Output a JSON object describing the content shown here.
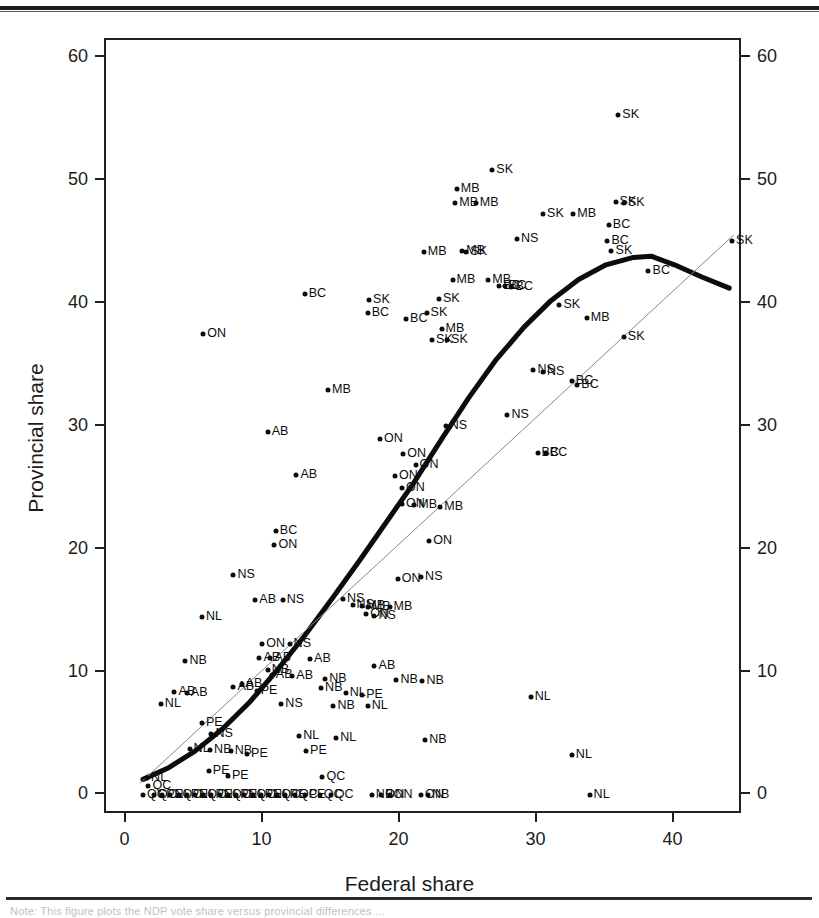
{
  "figure": {
    "caption": "Note: This figure plots the NDP vote share versus provincial differences ...",
    "xtitle": "Federal share",
    "ytitle": "Provincial share"
  },
  "axes": {
    "x_ticks": [
      "0",
      "10",
      "20",
      "30",
      "40"
    ],
    "y_ticks": [
      "0",
      "10",
      "20",
      "30",
      "40",
      "50",
      "60"
    ]
  },
  "chart_data": {
    "type": "scatter",
    "title": "",
    "xlabel": "Federal share",
    "ylabel": "Provincial share",
    "xlim": [
      -1.5,
      45.0
    ],
    "ylim": [
      -1.6,
      61.5
    ],
    "xticks": [
      0,
      10,
      20,
      30,
      40
    ],
    "yticks": [
      0,
      10,
      20,
      30,
      40,
      50,
      60
    ],
    "grid": false,
    "legend": false,
    "point_label_field": "province",
    "series": [
      {
        "name": "Provincial vs federal NDP share",
        "marker": "filled-circle",
        "color": "#0c0c0c",
        "points": [
          {
            "x": 35.9,
            "y": 55.4,
            "label": "SK"
          },
          {
            "x": 26.7,
            "y": 50.9,
            "label": "SK"
          },
          {
            "x": 24.1,
            "y": 49.4,
            "label": "MB"
          },
          {
            "x": 24.0,
            "y": 48.2,
            "label": "MB"
          },
          {
            "x": 25.5,
            "y": 48.2,
            "label": "MB"
          },
          {
            "x": 35.7,
            "y": 48.3,
            "label": "SK"
          },
          {
            "x": 36.3,
            "y": 48.2,
            "label": "SK"
          },
          {
            "x": 30.4,
            "y": 47.3,
            "label": "SK"
          },
          {
            "x": 32.6,
            "y": 47.3,
            "label": "MB"
          },
          {
            "x": 35.2,
            "y": 46.4,
            "label": "BC"
          },
          {
            "x": 35.1,
            "y": 45.1,
            "label": "BC"
          },
          {
            "x": 28.5,
            "y": 45.3,
            "label": "NS"
          },
          {
            "x": 35.4,
            "y": 44.3,
            "label": "SK"
          },
          {
            "x": 44.2,
            "y": 45.1,
            "label": "SK"
          },
          {
            "x": 21.7,
            "y": 44.2,
            "label": "MB"
          },
          {
            "x": 24.5,
            "y": 44.3,
            "label": "MB"
          },
          {
            "x": 24.8,
            "y": 44.2,
            "label": "SK"
          },
          {
            "x": 38.1,
            "y": 42.7,
            "label": "BC"
          },
          {
            "x": 23.8,
            "y": 42.0,
            "label": "MB"
          },
          {
            "x": 26.4,
            "y": 42.0,
            "label": "MB"
          },
          {
            "x": 27.2,
            "y": 41.5,
            "label": "BC"
          },
          {
            "x": 27.6,
            "y": 41.5,
            "label": "BC"
          },
          {
            "x": 28.1,
            "y": 41.4,
            "label": "BC"
          },
          {
            "x": 13.0,
            "y": 40.8,
            "label": "BC"
          },
          {
            "x": 17.7,
            "y": 40.3,
            "label": "SK"
          },
          {
            "x": 22.8,
            "y": 40.4,
            "label": "SK"
          },
          {
            "x": 17.6,
            "y": 39.3,
            "label": "BC"
          },
          {
            "x": 31.6,
            "y": 39.9,
            "label": "SK"
          },
          {
            "x": 21.9,
            "y": 39.3,
            "label": "SK"
          },
          {
            "x": 33.6,
            "y": 38.9,
            "label": "MB"
          },
          {
            "x": 20.4,
            "y": 38.8,
            "label": "BC"
          },
          {
            "x": 5.6,
            "y": 37.6,
            "label": "ON"
          },
          {
            "x": 36.3,
            "y": 37.3,
            "label": "SK"
          },
          {
            "x": 23.0,
            "y": 38.0,
            "label": "MB"
          },
          {
            "x": 22.3,
            "y": 37.1,
            "label": "SK"
          },
          {
            "x": 23.4,
            "y": 37.1,
            "label": "SK"
          },
          {
            "x": 29.7,
            "y": 34.6,
            "label": "NS"
          },
          {
            "x": 30.4,
            "y": 34.5,
            "label": "NS"
          },
          {
            "x": 32.5,
            "y": 33.7,
            "label": "BC"
          },
          {
            "x": 32.9,
            "y": 33.4,
            "label": "BC"
          },
          {
            "x": 14.7,
            "y": 33.0,
            "label": "MB"
          },
          {
            "x": 27.8,
            "y": 31.0,
            "label": "NS"
          },
          {
            "x": 10.3,
            "y": 29.6,
            "label": "AB"
          },
          {
            "x": 18.5,
            "y": 29.0,
            "label": "ON"
          },
          {
            "x": 23.3,
            "y": 30.1,
            "label": "NS"
          },
          {
            "x": 20.2,
            "y": 27.8,
            "label": "ON"
          },
          {
            "x": 21.1,
            "y": 26.9,
            "label": "ON"
          },
          {
            "x": 19.6,
            "y": 26.0,
            "label": "ON"
          },
          {
            "x": 12.4,
            "y": 26.1,
            "label": "AB"
          },
          {
            "x": 20.1,
            "y": 25.0,
            "label": "ON"
          },
          {
            "x": 30.0,
            "y": 27.9,
            "label": "BC"
          },
          {
            "x": 30.6,
            "y": 27.9,
            "label": "BC"
          },
          {
            "x": 20.1,
            "y": 23.7,
            "label": "ON"
          },
          {
            "x": 21.0,
            "y": 23.6,
            "label": "MB"
          },
          {
            "x": 22.9,
            "y": 23.5,
            "label": "MB"
          },
          {
            "x": 10.9,
            "y": 21.5,
            "label": "BC"
          },
          {
            "x": 10.8,
            "y": 20.4,
            "label": "ON"
          },
          {
            "x": 22.1,
            "y": 20.7,
            "label": "ON"
          },
          {
            "x": 7.8,
            "y": 17.9,
            "label": "NS"
          },
          {
            "x": 21.5,
            "y": 17.8,
            "label": "NS"
          },
          {
            "x": 19.8,
            "y": 17.6,
            "label": "ON"
          },
          {
            "x": 9.4,
            "y": 15.9,
            "label": "AB"
          },
          {
            "x": 11.4,
            "y": 15.9,
            "label": "NS"
          },
          {
            "x": 15.8,
            "y": 16.0,
            "label": "NS"
          },
          {
            "x": 16.5,
            "y": 15.5,
            "label": "NS"
          },
          {
            "x": 17.2,
            "y": 15.4,
            "label": "MB"
          },
          {
            "x": 17.6,
            "y": 15.3,
            "label": "MB"
          },
          {
            "x": 19.2,
            "y": 15.3,
            "label": "MB"
          },
          {
            "x": 17.5,
            "y": 14.8,
            "label": "ON"
          },
          {
            "x": 18.1,
            "y": 14.6,
            "label": "NS"
          },
          {
            "x": 5.5,
            "y": 14.5,
            "label": "NL"
          },
          {
            "x": 9.9,
            "y": 12.3,
            "label": "ON"
          },
          {
            "x": 11.9,
            "y": 12.3,
            "label": "NS"
          },
          {
            "x": 9.7,
            "y": 11.2,
            "label": "AB"
          },
          {
            "x": 10.5,
            "y": 11.2,
            "label": "AB"
          },
          {
            "x": 13.4,
            "y": 11.1,
            "label": "AB"
          },
          {
            "x": 4.3,
            "y": 10.9,
            "label": "NB"
          },
          {
            "x": 10.3,
            "y": 10.2,
            "label": "NB"
          },
          {
            "x": 18.1,
            "y": 10.5,
            "label": "AB"
          },
          {
            "x": 10.6,
            "y": 9.8,
            "label": "AB"
          },
          {
            "x": 12.1,
            "y": 9.7,
            "label": "AB"
          },
          {
            "x": 14.5,
            "y": 9.5,
            "label": "NB"
          },
          {
            "x": 19.7,
            "y": 9.4,
            "label": "NB"
          },
          {
            "x": 21.6,
            "y": 9.3,
            "label": "NB"
          },
          {
            "x": 8.4,
            "y": 9.1,
            "label": "AB"
          },
          {
            "x": 7.8,
            "y": 8.8,
            "label": "AB"
          },
          {
            "x": 3.5,
            "y": 8.4,
            "label": "AB"
          },
          {
            "x": 4.4,
            "y": 8.3,
            "label": "AB"
          },
          {
            "x": 9.5,
            "y": 8.5,
            "label": "PE"
          },
          {
            "x": 14.2,
            "y": 8.7,
            "label": "NB"
          },
          {
            "x": 16.0,
            "y": 8.3,
            "label": "NL"
          },
          {
            "x": 17.2,
            "y": 8.2,
            "label": "PE"
          },
          {
            "x": 29.5,
            "y": 8.0,
            "label": "NL"
          },
          {
            "x": 2.5,
            "y": 7.4,
            "label": "NL"
          },
          {
            "x": 11.3,
            "y": 7.4,
            "label": "NS"
          },
          {
            "x": 15.1,
            "y": 7.3,
            "label": "NB"
          },
          {
            "x": 17.6,
            "y": 7.3,
            "label": "NL"
          },
          {
            "x": 5.5,
            "y": 5.9,
            "label": "PE"
          },
          {
            "x": 6.2,
            "y": 5.0,
            "label": "NS"
          },
          {
            "x": 12.6,
            "y": 4.8,
            "label": "NL"
          },
          {
            "x": 15.3,
            "y": 4.7,
            "label": "NL"
          },
          {
            "x": 21.8,
            "y": 4.5,
            "label": "NB"
          },
          {
            "x": 4.6,
            "y": 3.8,
            "label": "NL"
          },
          {
            "x": 6.1,
            "y": 3.7,
            "label": "NB"
          },
          {
            "x": 7.6,
            "y": 3.6,
            "label": "NB"
          },
          {
            "x": 8.8,
            "y": 3.4,
            "label": "PE"
          },
          {
            "x": 13.1,
            "y": 3.6,
            "label": "PE"
          },
          {
            "x": 32.5,
            "y": 3.3,
            "label": "NL"
          },
          {
            "x": 6.0,
            "y": 2.0,
            "label": "PE"
          },
          {
            "x": 7.4,
            "y": 1.6,
            "label": "PE"
          },
          {
            "x": 14.3,
            "y": 1.5,
            "label": "QC"
          },
          {
            "x": 1.5,
            "y": 1.4,
            "label": "NL"
          },
          {
            "x": 1.6,
            "y": 0.8,
            "label": "QC"
          },
          {
            "x": 1.2,
            "y": 0.0,
            "label": "QC"
          },
          {
            "x": 2.0,
            "y": 0.0,
            "label": "QC"
          },
          {
            "x": 2.6,
            "y": 0.0,
            "label": "PE"
          },
          {
            "x": 3.2,
            "y": 0.0,
            "label": "NL"
          },
          {
            "x": 3.8,
            "y": 0.0,
            "label": "QC"
          },
          {
            "x": 4.4,
            "y": 0.0,
            "label": "PE"
          },
          {
            "x": 5.0,
            "y": 0.0,
            "label": "NL"
          },
          {
            "x": 5.6,
            "y": 0.0,
            "label": "QC"
          },
          {
            "x": 6.2,
            "y": 0.0,
            "label": "PE"
          },
          {
            "x": 6.8,
            "y": 0.0,
            "label": "NL"
          },
          {
            "x": 7.4,
            "y": 0.0,
            "label": "QC"
          },
          {
            "x": 8.0,
            "y": 0.0,
            "label": "PE"
          },
          {
            "x": 8.6,
            "y": 0.0,
            "label": "NL"
          },
          {
            "x": 9.2,
            "y": 0.0,
            "label": "QC"
          },
          {
            "x": 9.8,
            "y": 0.0,
            "label": "PE"
          },
          {
            "x": 10.4,
            "y": 0.0,
            "label": "NL"
          },
          {
            "x": 11.0,
            "y": 0.0,
            "label": "QC"
          },
          {
            "x": 11.6,
            "y": 0.0,
            "label": "PE"
          },
          {
            "x": 12.3,
            "y": 0.0,
            "label": "QC"
          },
          {
            "x": 13.0,
            "y": 0.0,
            "label": "PE"
          },
          {
            "x": 14.1,
            "y": 0.0,
            "label": "QC"
          },
          {
            "x": 14.9,
            "y": 0.0,
            "label": "QC"
          },
          {
            "x": 17.9,
            "y": 0.0,
            "label": "NB"
          },
          {
            "x": 18.6,
            "y": 0.0,
            "label": "ON"
          },
          {
            "x": 19.2,
            "y": 0.0,
            "label": "ON"
          },
          {
            "x": 21.5,
            "y": 0.0,
            "label": "ON"
          },
          {
            "x": 22.0,
            "y": 0.0,
            "label": "NB"
          },
          {
            "x": 33.8,
            "y": 0.0,
            "label": "NL"
          }
        ]
      }
    ],
    "lines": [
      {
        "name": "lowess-fit",
        "style": "thick-solid",
        "color": "#0c0c0c",
        "width_px": 5,
        "points": [
          {
            "x": 1.2,
            "y": 1.3
          },
          {
            "x": 3.0,
            "y": 2.2
          },
          {
            "x": 5.0,
            "y": 3.6
          },
          {
            "x": 7.0,
            "y": 5.4
          },
          {
            "x": 9.0,
            "y": 7.6
          },
          {
            "x": 11.0,
            "y": 10.2
          },
          {
            "x": 13.0,
            "y": 13.0
          },
          {
            "x": 15.0,
            "y": 16.0
          },
          {
            "x": 17.0,
            "y": 19.1
          },
          {
            "x": 19.0,
            "y": 22.3
          },
          {
            "x": 21.0,
            "y": 25.5
          },
          {
            "x": 23.0,
            "y": 29.0
          },
          {
            "x": 25.0,
            "y": 32.4
          },
          {
            "x": 27.0,
            "y": 35.5
          },
          {
            "x": 29.0,
            "y": 38.1
          },
          {
            "x": 31.0,
            "y": 40.3
          },
          {
            "x": 33.0,
            "y": 42.0
          },
          {
            "x": 35.0,
            "y": 43.2
          },
          {
            "x": 37.0,
            "y": 43.8
          },
          {
            "x": 38.3,
            "y": 43.9
          },
          {
            "x": 40.0,
            "y": 43.2
          },
          {
            "x": 42.0,
            "y": 42.2
          },
          {
            "x": 44.0,
            "y": 41.3
          }
        ]
      },
      {
        "name": "45-degree-reference-line",
        "style": "thin-solid",
        "color": "#888888",
        "width_px": 1,
        "points": [
          {
            "x": 1.0,
            "y": 1.0
          },
          {
            "x": 44.3,
            "y": 45.6
          }
        ]
      }
    ]
  }
}
